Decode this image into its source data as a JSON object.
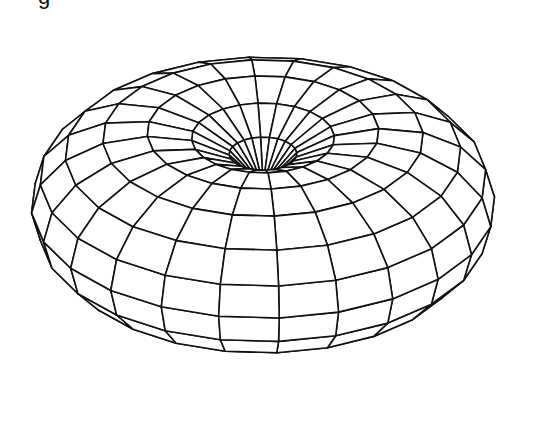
{
  "figure": {
    "corner_label": "g",
    "colors": {
      "background": "#ffffff",
      "line": "#111111",
      "fill": "#ffffff"
    },
    "mesh": {
      "u_segments": 24,
      "v_segments": 16,
      "major_radius": 1.0,
      "minor_radius": 1.0
    },
    "projection": {
      "center_x": 263,
      "center_y": 205,
      "scale_x": 116,
      "scale_y": 92,
      "tilt_deg": 38,
      "rotation_deg": 4,
      "line_width": 1.6
    }
  }
}
